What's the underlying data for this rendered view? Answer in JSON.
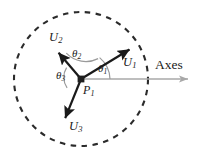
{
  "figure": {
    "title": "",
    "colors": {
      "ink": "#1a1a1a",
      "axis": "#9a9a9a",
      "circle": "#2b2b2b",
      "arc": "#8c8c8c",
      "background": "#ffffff"
    },
    "center_point": {
      "name": "P1",
      "label_base": "P",
      "label_sub": "1",
      "x": 81,
      "y": 79
    },
    "boundary_circle": {
      "style": "dashed",
      "cx": 81,
      "cy": 79,
      "r": 67
    },
    "axis_arrow": {
      "label": "Axes",
      "from_x": 81,
      "from_y": 79,
      "to_x": 190,
      "to_y": 79,
      "label_x": 156,
      "label_y": 59
    },
    "vectors": [
      {
        "name": "U1",
        "label_base": "U",
        "label_sub": "1",
        "tip_x": 131,
        "tip_y": 48,
        "label_x": 126,
        "label_y": 58
      },
      {
        "name": "U2",
        "label_base": "U",
        "label_sub": "2",
        "tip_x": 57,
        "tip_y": 51,
        "label_x": 50,
        "label_y": 34
      },
      {
        "name": "U3",
        "label_base": "U",
        "label_sub": "3",
        "tip_x": 64,
        "tip_y": 120,
        "label_x": 70,
        "label_y": 122
      }
    ],
    "angles": [
      {
        "name": "theta1",
        "label_base": "θ",
        "label_sub": "1",
        "between": [
          "axis",
          "U1"
        ],
        "label_x": 99,
        "label_y": 65
      },
      {
        "name": "theta2",
        "label_base": "θ",
        "label_sub": "2",
        "between": [
          "U1",
          "U2"
        ],
        "label_x": 73,
        "label_y": 50
      },
      {
        "name": "theta3",
        "label_base": "θ",
        "label_sub": "3",
        "between": [
          "U2",
          "U3"
        ],
        "label_x": 57,
        "label_y": 71
      }
    ]
  }
}
